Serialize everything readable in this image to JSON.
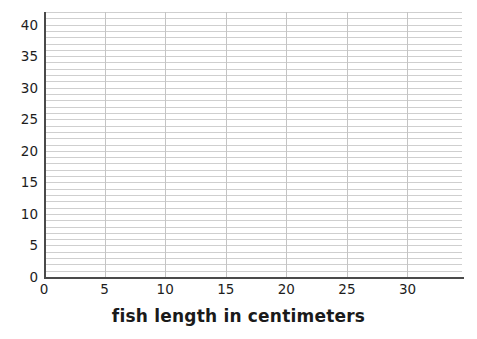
{
  "chart_data": {
    "type": "scatter",
    "title": "",
    "subtitle": "",
    "xlabel": "fish length in centimeters",
    "ylabel": "",
    "xlim": [
      0,
      34.5
    ],
    "ylim": [
      0,
      42
    ],
    "x_ticks": [
      0,
      5,
      10,
      15,
      20,
      25,
      30
    ],
    "x_tick_labels": [
      "0",
      "5",
      "10",
      "15",
      "20",
      "25",
      "30"
    ],
    "y_ticks": [
      0,
      5,
      10,
      15,
      20,
      25,
      30,
      35,
      40
    ],
    "y_tick_labels": [
      "0",
      "5",
      "10",
      "15",
      "20",
      "25",
      "30",
      "35",
      "40"
    ],
    "x_minor_step": 5,
    "y_minor_step": 1,
    "grid": {
      "horizontal": true,
      "vertical": true,
      "horizontal_step": 1,
      "vertical_step": 5,
      "color": "#cfcfcf"
    },
    "legend": null,
    "annotations": [],
    "series": [],
    "values": [],
    "categories": [],
    "note": "empty coordinate grid with no plotted data"
  },
  "axes": {
    "x_title": "fish length in centimeters",
    "y_title": "",
    "x_tick_labels": [
      "0",
      "5",
      "10",
      "15",
      "20",
      "25",
      "30"
    ],
    "y_tick_labels": [
      "0",
      "5",
      "10",
      "15",
      "20",
      "25",
      "30",
      "35",
      "40"
    ]
  },
  "colors": {
    "background": "#ffffff",
    "gridline": "#cfcfcf",
    "gridline_major": "#c4c4c4",
    "axis_line": "#4a4a4a",
    "text": "#1d1d1d",
    "title_text": "#1a1a1a"
  }
}
